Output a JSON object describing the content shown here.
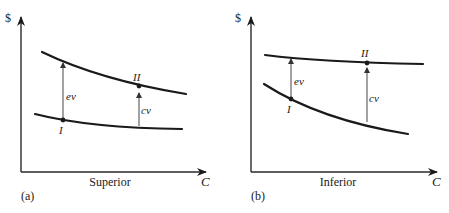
{
  "panels": [
    {
      "id": "a",
      "tag": "(a)",
      "y_axis_label": "$",
      "x_axis_label": "C",
      "x_caption": "Superior",
      "point_labels": {
        "initial": "I",
        "final": "II"
      },
      "arrow_labels": {
        "equivalent": "ev",
        "compensating": "cv"
      }
    },
    {
      "id": "b",
      "tag": "(b)",
      "y_axis_label": "$",
      "x_axis_label": "C",
      "x_caption": "Inferior",
      "point_labels": {
        "initial": "I",
        "final": "II"
      },
      "arrow_labels": {
        "equivalent": "ev",
        "compensating": "cv"
      }
    }
  ],
  "colors": {
    "ink": "#1a1a1a",
    "arrow": "#555555",
    "background": "#ffffff"
  }
}
